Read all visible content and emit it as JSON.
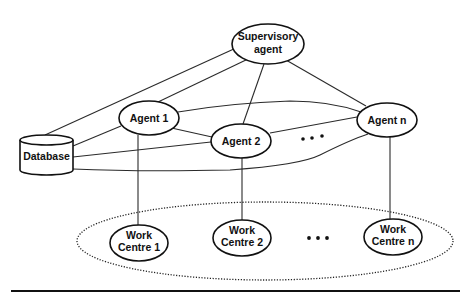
{
  "diagram": {
    "nodes": {
      "supervisory": {
        "line1": "Supervisory",
        "line2": "agent"
      },
      "agent1": {
        "label": "Agent 1"
      },
      "agent2": {
        "label": "Agent 2"
      },
      "agentn": {
        "label": "Agent n"
      },
      "database": {
        "label": "Database"
      },
      "wc1": {
        "line1": "Work",
        "line2": "Centre 1"
      },
      "wc2": {
        "line1": "Work",
        "line2": "Centre 2"
      },
      "wcn": {
        "line1": "Work",
        "line2": "Centre n"
      }
    },
    "edges": [
      {
        "from": "Supervisory agent",
        "to": "Database"
      },
      {
        "from": "Supervisory agent",
        "to": "Agent 1"
      },
      {
        "from": "Supervisory agent",
        "to": "Agent 2"
      },
      {
        "from": "Supervisory agent",
        "to": "Agent n"
      },
      {
        "from": "Agent 1",
        "to": "Agent 2"
      },
      {
        "from": "Agent 1",
        "to": "Agent n"
      },
      {
        "from": "Agent 2",
        "to": "Agent n"
      },
      {
        "from": "Database",
        "to": "Agent 1"
      },
      {
        "from": "Database",
        "to": "Agent 2"
      },
      {
        "from": "Database",
        "to": "Agent n"
      },
      {
        "from": "Agent 1",
        "to": "Work Centre 1"
      },
      {
        "from": "Agent 2",
        "to": "Work Centre 2"
      },
      {
        "from": "Agent n",
        "to": "Work Centre n"
      }
    ],
    "groups": [
      {
        "name": "work-centres",
        "members": [
          "Work Centre 1",
          "Work Centre 2",
          "Work Centre n"
        ],
        "style": "dotted ellipse"
      }
    ],
    "ellipsis_markers": [
      "between Agent 2 and Agent n",
      "between Work Centre 2 and Work Centre n"
    ]
  }
}
